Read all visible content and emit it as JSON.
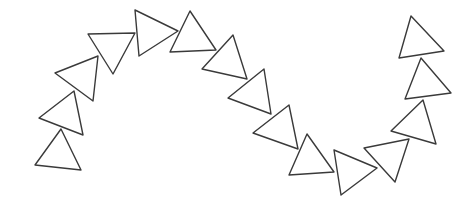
{
  "figure": {
    "stroke_color": "#3a3a3a",
    "fill_color": "#ffffff",
    "background": "#ffffff",
    "triangles": [
      {
        "id": 1,
        "points": [
          [
            61,
            129
          ],
          [
            35,
            165
          ],
          [
            81,
            170
          ]
        ]
      },
      {
        "id": 2,
        "points": [
          [
            39,
            118
          ],
          [
            74,
            91
          ],
          [
            83,
            135
          ]
        ]
      },
      {
        "id": 3,
        "points": [
          [
            55,
            73
          ],
          [
            98,
            56
          ],
          [
            93,
            101
          ]
        ]
      },
      {
        "id": 4,
        "points": [
          [
            88,
            34
          ],
          [
            135,
            33
          ],
          [
            113,
            74
          ]
        ]
      },
      {
        "id": 5,
        "points": [
          [
            135,
            10
          ],
          [
            178,
            31
          ],
          [
            139,
            56
          ]
        ]
      },
      {
        "id": 6,
        "points": [
          [
            170,
            52
          ],
          [
            190,
            11
          ],
          [
            216,
            50
          ]
        ]
      },
      {
        "id": 7,
        "points": [
          [
            202,
            69
          ],
          [
            233,
            35
          ],
          [
            247,
            79
          ]
        ]
      },
      {
        "id": 8,
        "points": [
          [
            228,
            98
          ],
          [
            264,
            69
          ],
          [
            271,
            114
          ]
        ]
      },
      {
        "id": 9,
        "points": [
          [
            253,
            133
          ],
          [
            289,
            105
          ],
          [
            298,
            149
          ]
        ]
      },
      {
        "id": 10,
        "points": [
          [
            289,
            175
          ],
          [
            307,
            134
          ],
          [
            334,
            172
          ]
        ]
      },
      {
        "id": 11,
        "points": [
          [
            334,
            150
          ],
          [
            377,
            168
          ],
          [
            341,
            195
          ]
        ]
      },
      {
        "id": 12,
        "points": [
          [
            364,
            148
          ],
          [
            409,
            139
          ],
          [
            395,
            182
          ]
        ]
      },
      {
        "id": 13,
        "points": [
          [
            391,
            131
          ],
          [
            423,
            100
          ],
          [
            436,
            144
          ]
        ]
      },
      {
        "id": 14,
        "points": [
          [
            405,
            99
          ],
          [
            421,
            58
          ],
          [
            451,
            93
          ]
        ]
      },
      {
        "id": 15,
        "points": [
          [
            399,
            58
          ],
          [
            411,
            16
          ],
          [
            444,
            51
          ]
        ]
      }
    ]
  }
}
